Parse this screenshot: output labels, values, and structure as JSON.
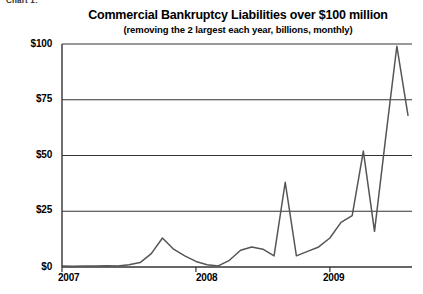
{
  "page": {
    "clipped_header": "Chart 1:"
  },
  "chart_data": {
    "type": "line",
    "title": "Commercial Bankruptcy Liabilities over $100 million",
    "subtitle": "(removing the 2 largest each year, billions, monthly)",
    "xlabel": "",
    "ylabel": "",
    "ylim": [
      0,
      100
    ],
    "xlim": [
      "2007",
      "2009"
    ],
    "grid": true,
    "legend": false,
    "y_ticks": [
      "$0",
      "$25",
      "$50",
      "$75",
      "$100"
    ],
    "y_tick_values": [
      0,
      25,
      50,
      75,
      100
    ],
    "x_ticks": [
      "2007",
      "2008",
      "2009"
    ],
    "line_color": "#555555",
    "axis_color": "#333333",
    "series": [
      {
        "name": "Commercial Bankruptcy Liabilities over $100 million",
        "x": [
          "2007-01",
          "2007-02",
          "2007-03",
          "2007-04",
          "2007-05",
          "2007-06",
          "2007-07",
          "2007-08",
          "2007-09",
          "2007-10",
          "2007-11",
          "2007-12",
          "2008-01",
          "2008-02",
          "2008-03",
          "2008-04",
          "2008-05",
          "2008-06",
          "2008-07",
          "2008-08",
          "2008-09",
          "2008-10",
          "2008-11",
          "2008-12",
          "2009-01",
          "2009-02",
          "2009-03",
          "2009-04",
          "2009-05",
          "2009-06",
          "2009-07",
          "2009-08"
        ],
        "values": [
          0.4,
          0.3,
          0.5,
          0.4,
          0.6,
          0.5,
          1.0,
          2.0,
          6.0,
          13.0,
          8.0,
          5.0,
          2.5,
          1.0,
          0.5,
          3.0,
          7.5,
          9.0,
          8.0,
          5.0,
          38.0,
          5.0,
          7.0,
          9.0,
          13.0,
          20.0,
          23.0,
          52.0,
          16.0,
          58.0,
          99.0,
          68.0
        ]
      }
    ]
  }
}
